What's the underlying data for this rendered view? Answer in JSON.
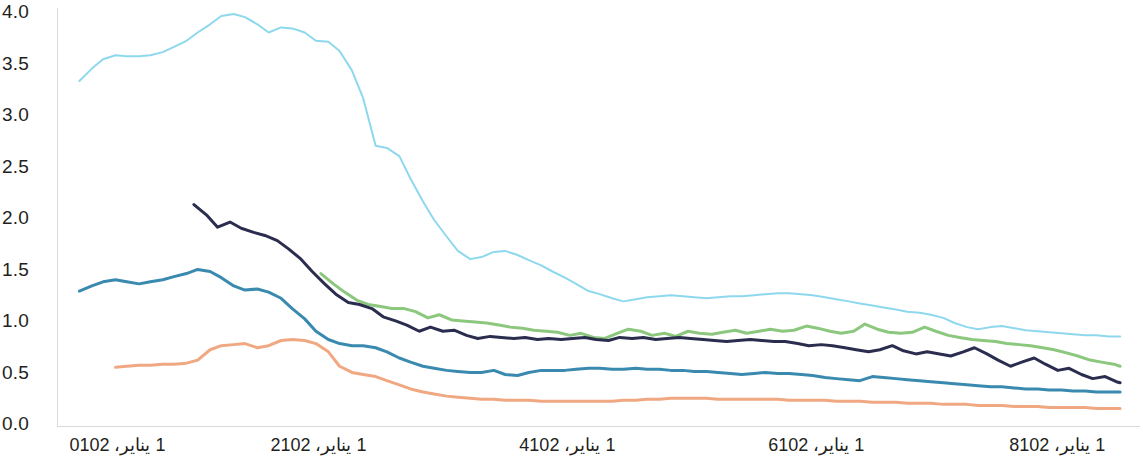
{
  "chart_data": {
    "type": "line",
    "title": "",
    "subtitle": "",
    "xlabel": "",
    "ylabel": "",
    "grid": false,
    "legend_position": "none",
    "ylim": [
      0.0,
      4.0
    ],
    "ytick_labels": [
      "4.0",
      "3.5",
      "3.0",
      "2.5",
      "2.0",
      "1.5",
      "1.0",
      "0.5",
      "0.0"
    ],
    "ytick_values": [
      4.0,
      3.5,
      3.0,
      2.5,
      2.0,
      1.5,
      1.0,
      0.5,
      0.0
    ],
    "xtick_labels": [
      "1 يناير، 2010",
      "1 يناير، 2012",
      "1 يناير، 2014",
      "1 يناير، 2016",
      "1 يناير، 2018"
    ],
    "xtick_values": [
      2010.0,
      2012.0,
      2014.0,
      2016.0,
      2018.0
    ],
    "xlim": [
      2009.9,
      2018.6
    ],
    "series": [
      {
        "name": "series-light-cyan",
        "color": "#8ed8ee",
        "x": [
          2010.08,
          2010.18,
          2010.27,
          2010.37,
          2010.46,
          2010.56,
          2010.65,
          2010.75,
          2010.84,
          2010.94,
          2011.03,
          2011.13,
          2011.22,
          2011.32,
          2011.41,
          2011.51,
          2011.6,
          2011.7,
          2011.79,
          2011.89,
          2011.98,
          2012.08,
          2012.17,
          2012.27,
          2012.36,
          2012.46,
          2012.55,
          2012.65,
          2012.74,
          2012.84,
          2012.93,
          2013.03,
          2013.12,
          2013.22,
          2013.31,
          2013.41,
          2013.5,
          2013.6,
          2013.69,
          2013.79,
          2013.88,
          2013.98,
          2014.07,
          2014.17,
          2014.26,
          2014.36,
          2014.45,
          2014.55,
          2014.64,
          2014.74,
          2014.83,
          2014.93,
          2015.02,
          2015.12,
          2015.21,
          2015.31,
          2015.4,
          2015.5,
          2015.59,
          2015.69,
          2015.78,
          2015.88,
          2015.97,
          2016.07,
          2016.16,
          2016.26,
          2016.35,
          2016.45,
          2016.54,
          2016.64,
          2016.73,
          2016.83,
          2016.92,
          2017.02,
          2017.11,
          2017.21,
          2017.3,
          2017.4,
          2017.49,
          2017.59,
          2017.68,
          2017.78,
          2017.87,
          2017.97,
          2018.06,
          2018.16,
          2018.25,
          2018.35,
          2018.44
        ],
        "y": [
          3.35,
          3.47,
          3.56,
          3.6,
          3.59,
          3.59,
          3.6,
          3.63,
          3.68,
          3.74,
          3.82,
          3.9,
          3.98,
          4.0,
          3.97,
          3.9,
          3.82,
          3.87,
          3.86,
          3.82,
          3.74,
          3.73,
          3.64,
          3.45,
          3.18,
          2.72,
          2.7,
          2.62,
          2.4,
          2.18,
          2.0,
          1.84,
          1.7,
          1.62,
          1.64,
          1.69,
          1.7,
          1.66,
          1.61,
          1.56,
          1.5,
          1.44,
          1.38,
          1.31,
          1.28,
          1.24,
          1.21,
          1.23,
          1.25,
          1.26,
          1.27,
          1.26,
          1.25,
          1.24,
          1.25,
          1.26,
          1.26,
          1.27,
          1.28,
          1.29,
          1.29,
          1.28,
          1.27,
          1.25,
          1.23,
          1.21,
          1.19,
          1.17,
          1.15,
          1.13,
          1.11,
          1.1,
          1.08,
          1.05,
          1.0,
          0.96,
          0.94,
          0.96,
          0.97,
          0.95,
          0.93,
          0.92,
          0.91,
          0.9,
          0.89,
          0.88,
          0.88,
          0.87,
          0.87
        ]
      },
      {
        "name": "series-green",
        "color": "#8cc77e",
        "x": [
          2012.02,
          2012.12,
          2012.21,
          2012.31,
          2012.4,
          2012.5,
          2012.59,
          2012.69,
          2012.78,
          2012.88,
          2012.97,
          2013.07,
          2013.16,
          2013.26,
          2013.35,
          2013.45,
          2013.54,
          2013.64,
          2013.73,
          2013.83,
          2013.92,
          2014.02,
          2014.11,
          2014.21,
          2014.3,
          2014.4,
          2014.49,
          2014.59,
          2014.68,
          2014.78,
          2014.87,
          2014.97,
          2015.06,
          2015.16,
          2015.25,
          2015.35,
          2015.44,
          2015.54,
          2015.63,
          2015.73,
          2015.82,
          2015.92,
          2016.01,
          2016.11,
          2016.2,
          2016.3,
          2016.39,
          2016.49,
          2016.58,
          2016.68,
          2016.77,
          2016.87,
          2016.96,
          2017.06,
          2017.15,
          2017.25,
          2017.34,
          2017.44,
          2017.53,
          2017.63,
          2017.72,
          2017.82,
          2017.91,
          2018.01,
          2018.1,
          2018.2,
          2018.29,
          2018.39,
          2018.44
        ],
        "y": [
          1.48,
          1.38,
          1.3,
          1.22,
          1.18,
          1.16,
          1.14,
          1.14,
          1.11,
          1.05,
          1.08,
          1.03,
          1.02,
          1.01,
          1.0,
          0.98,
          0.96,
          0.95,
          0.93,
          0.92,
          0.91,
          0.88,
          0.9,
          0.86,
          0.85,
          0.9,
          0.94,
          0.92,
          0.88,
          0.9,
          0.87,
          0.92,
          0.9,
          0.89,
          0.91,
          0.93,
          0.9,
          0.92,
          0.94,
          0.92,
          0.93,
          0.97,
          0.95,
          0.92,
          0.9,
          0.92,
          0.99,
          0.94,
          0.91,
          0.9,
          0.91,
          0.96,
          0.92,
          0.88,
          0.86,
          0.84,
          0.83,
          0.82,
          0.8,
          0.79,
          0.78,
          0.76,
          0.74,
          0.71,
          0.68,
          0.64,
          0.62,
          0.6,
          0.58
        ]
      },
      {
        "name": "series-navy",
        "color": "#2b2d4f",
        "x": [
          2011.0,
          2011.1,
          2011.19,
          2011.29,
          2011.38,
          2011.48,
          2011.57,
          2011.67,
          2011.76,
          2011.86,
          2011.95,
          2012.05,
          2012.14,
          2012.24,
          2012.33,
          2012.43,
          2012.52,
          2012.62,
          2012.71,
          2012.81,
          2012.9,
          2013.0,
          2013.09,
          2013.19,
          2013.28,
          2013.38,
          2013.47,
          2013.57,
          2013.66,
          2013.76,
          2013.85,
          2013.95,
          2014.04,
          2014.14,
          2014.23,
          2014.33,
          2014.42,
          2014.52,
          2014.61,
          2014.71,
          2014.8,
          2014.9,
          2014.99,
          2015.09,
          2015.18,
          2015.28,
          2015.37,
          2015.47,
          2015.56,
          2015.66,
          2015.75,
          2015.85,
          2015.94,
          2016.04,
          2016.13,
          2016.23,
          2016.32,
          2016.42,
          2016.51,
          2016.61,
          2016.7,
          2016.8,
          2016.89,
          2016.99,
          2017.08,
          2017.18,
          2017.27,
          2017.37,
          2017.46,
          2017.56,
          2017.65,
          2017.75,
          2017.84,
          2017.94,
          2018.03,
          2018.13,
          2018.22,
          2018.32,
          2018.41,
          2018.44
        ],
        "y": [
          2.15,
          2.05,
          1.93,
          1.98,
          1.92,
          1.88,
          1.85,
          1.8,
          1.72,
          1.62,
          1.5,
          1.38,
          1.28,
          1.2,
          1.18,
          1.14,
          1.06,
          1.02,
          0.98,
          0.92,
          0.96,
          0.92,
          0.93,
          0.88,
          0.85,
          0.87,
          0.86,
          0.85,
          0.86,
          0.84,
          0.85,
          0.84,
          0.85,
          0.86,
          0.84,
          0.83,
          0.86,
          0.85,
          0.86,
          0.84,
          0.85,
          0.86,
          0.85,
          0.84,
          0.83,
          0.82,
          0.83,
          0.84,
          0.83,
          0.82,
          0.82,
          0.8,
          0.78,
          0.79,
          0.78,
          0.76,
          0.74,
          0.72,
          0.74,
          0.78,
          0.73,
          0.7,
          0.72,
          0.7,
          0.68,
          0.72,
          0.76,
          0.7,
          0.64,
          0.58,
          0.62,
          0.66,
          0.6,
          0.54,
          0.56,
          0.5,
          0.46,
          0.48,
          0.43,
          0.42
        ]
      },
      {
        "name": "series-steel-blue",
        "color": "#3a8ab0",
        "x": [
          2010.08,
          2010.18,
          2010.27,
          2010.37,
          2010.46,
          2010.56,
          2010.65,
          2010.75,
          2010.84,
          2010.94,
          2011.03,
          2011.13,
          2011.22,
          2011.32,
          2011.41,
          2011.51,
          2011.6,
          2011.7,
          2011.79,
          2011.89,
          2011.98,
          2012.08,
          2012.17,
          2012.27,
          2012.36,
          2012.46,
          2012.55,
          2012.65,
          2012.74,
          2012.84,
          2012.93,
          2013.03,
          2013.12,
          2013.22,
          2013.31,
          2013.41,
          2013.5,
          2013.6,
          2013.69,
          2013.79,
          2013.88,
          2013.98,
          2014.07,
          2014.17,
          2014.26,
          2014.36,
          2014.45,
          2014.55,
          2014.64,
          2014.74,
          2014.83,
          2014.93,
          2015.02,
          2015.12,
          2015.21,
          2015.31,
          2015.4,
          2015.5,
          2015.59,
          2015.69,
          2015.78,
          2015.88,
          2015.97,
          2016.07,
          2016.16,
          2016.26,
          2016.35,
          2016.45,
          2016.54,
          2016.64,
          2016.73,
          2016.83,
          2016.92,
          2017.02,
          2017.11,
          2017.21,
          2017.3,
          2017.4,
          2017.49,
          2017.59,
          2017.68,
          2017.78,
          2017.87,
          2017.97,
          2018.06,
          2018.16,
          2018.25,
          2018.35,
          2018.44
        ],
        "y": [
          1.31,
          1.36,
          1.4,
          1.42,
          1.4,
          1.38,
          1.4,
          1.42,
          1.45,
          1.48,
          1.52,
          1.5,
          1.44,
          1.36,
          1.32,
          1.33,
          1.3,
          1.24,
          1.14,
          1.04,
          0.92,
          0.84,
          0.8,
          0.78,
          0.78,
          0.76,
          0.72,
          0.66,
          0.62,
          0.58,
          0.56,
          0.54,
          0.53,
          0.52,
          0.52,
          0.54,
          0.5,
          0.49,
          0.52,
          0.54,
          0.54,
          0.54,
          0.55,
          0.56,
          0.56,
          0.55,
          0.55,
          0.56,
          0.55,
          0.55,
          0.54,
          0.54,
          0.53,
          0.53,
          0.52,
          0.51,
          0.5,
          0.51,
          0.52,
          0.51,
          0.51,
          0.5,
          0.49,
          0.47,
          0.46,
          0.45,
          0.44,
          0.48,
          0.47,
          0.46,
          0.45,
          0.44,
          0.43,
          0.42,
          0.41,
          0.4,
          0.39,
          0.38,
          0.38,
          0.37,
          0.36,
          0.36,
          0.35,
          0.35,
          0.34,
          0.34,
          0.33,
          0.33,
          0.33
        ]
      },
      {
        "name": "series-orange",
        "color": "#f0a882",
        "x": [
          2010.37,
          2010.46,
          2010.56,
          2010.65,
          2010.75,
          2010.84,
          2010.94,
          2011.03,
          2011.13,
          2011.22,
          2011.32,
          2011.41,
          2011.51,
          2011.6,
          2011.7,
          2011.79,
          2011.89,
          2011.98,
          2012.08,
          2012.17,
          2012.27,
          2012.36,
          2012.46,
          2012.55,
          2012.65,
          2012.74,
          2012.84,
          2012.93,
          2013.03,
          2013.12,
          2013.22,
          2013.31,
          2013.41,
          2013.5,
          2013.6,
          2013.69,
          2013.79,
          2013.88,
          2013.98,
          2014.07,
          2014.17,
          2014.26,
          2014.36,
          2014.45,
          2014.55,
          2014.64,
          2014.74,
          2014.83,
          2014.93,
          2015.02,
          2015.12,
          2015.21,
          2015.31,
          2015.4,
          2015.5,
          2015.59,
          2015.69,
          2015.78,
          2015.88,
          2015.97,
          2016.07,
          2016.16,
          2016.26,
          2016.35,
          2016.45,
          2016.54,
          2016.64,
          2016.73,
          2016.83,
          2016.92,
          2017.02,
          2017.11,
          2017.21,
          2017.3,
          2017.4,
          2017.49,
          2017.59,
          2017.68,
          2017.78,
          2017.87,
          2017.97,
          2018.06,
          2018.16,
          2018.25,
          2018.35,
          2018.44
        ],
        "y": [
          0.57,
          0.58,
          0.59,
          0.59,
          0.6,
          0.6,
          0.61,
          0.64,
          0.74,
          0.78,
          0.79,
          0.8,
          0.76,
          0.78,
          0.83,
          0.84,
          0.83,
          0.8,
          0.72,
          0.58,
          0.52,
          0.5,
          0.48,
          0.44,
          0.4,
          0.36,
          0.33,
          0.31,
          0.29,
          0.28,
          0.27,
          0.26,
          0.26,
          0.25,
          0.25,
          0.25,
          0.24,
          0.24,
          0.24,
          0.24,
          0.24,
          0.24,
          0.24,
          0.25,
          0.25,
          0.26,
          0.26,
          0.27,
          0.27,
          0.27,
          0.27,
          0.26,
          0.26,
          0.26,
          0.26,
          0.26,
          0.26,
          0.25,
          0.25,
          0.25,
          0.25,
          0.24,
          0.24,
          0.24,
          0.23,
          0.23,
          0.23,
          0.22,
          0.22,
          0.22,
          0.21,
          0.21,
          0.21,
          0.2,
          0.2,
          0.2,
          0.19,
          0.19,
          0.19,
          0.18,
          0.18,
          0.18,
          0.18,
          0.17,
          0.17,
          0.17
        ]
      }
    ]
  },
  "axes": {
    "axis_color": "#d9d9d9",
    "background": "#ffffff",
    "tick_text_color": "#231f20"
  }
}
